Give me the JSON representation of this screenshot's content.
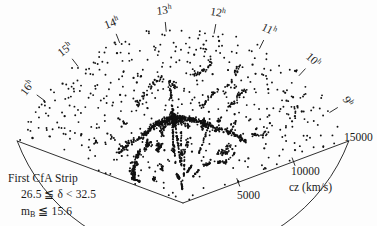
{
  "figure": {
    "name": "first-cfa-strip-redshift-wedge",
    "background_color": "#fdfdfd",
    "ink_color": "#1a1a1a"
  },
  "caption": {
    "line1": "First CfA Strip",
    "line2_pre": "26.5 ≦ δ < 32.5",
    "line3_pre": "m",
    "line3_sub": "B",
    "line3_post": " ≦ 15.6"
  },
  "axis": {
    "radial_title": "cz (km/s)",
    "tick_5000": "5000",
    "tick_10000": "10000",
    "tick_15000": "15000"
  },
  "hour_labels": [
    {
      "num": "16",
      "sup": "h"
    },
    {
      "num": "15",
      "sup": "h"
    },
    {
      "num": "14",
      "sup": "h"
    },
    {
      "num": "13",
      "sup": "h"
    },
    {
      "num": "12",
      "sup": "h"
    },
    {
      "num": "11",
      "sup": "h"
    },
    {
      "num": "10",
      "sup": "h"
    },
    {
      "num": "9",
      "sup": "h"
    }
  ],
  "chart_data": {
    "type": "scatter",
    "title": "First CfA Strip",
    "subtitle": "26.5 ≦ δ < 32.5, m_B ≦ 15.6",
    "projection": "polar-wedge",
    "xlabel": "Right Ascension (hours)",
    "ylabel": "cz (km/s)",
    "rlim": [
      0,
      15000
    ],
    "r_ticks": [
      5000,
      10000,
      15000
    ],
    "theta_label_unit": "h",
    "theta_ticks": [
      9,
      10,
      11,
      12,
      13,
      14,
      15,
      16
    ],
    "theta_range_hours": [
      8.3,
      17.0
    ],
    "grid": false,
    "legend": null,
    "annotations": [
      "Stickman structure near 13h, cz ~ 7000 km/s"
    ],
    "n_points": 1100,
    "geometry": {
      "apex_px": [
        183,
        203
      ],
      "radius_px": 177,
      "start_angle_deg": 200.5,
      "end_angle_deg": 339.5
    },
    "points_polar": [
      [
        16.82,
        13900
      ],
      [
        16.7,
        14300
      ],
      [
        16.62,
        12600
      ],
      [
        16.55,
        14800
      ],
      [
        16.48,
        13200
      ],
      [
        16.4,
        11700
      ],
      [
        16.36,
        14200
      ],
      [
        16.3,
        12100
      ],
      [
        16.22,
        13600
      ],
      [
        16.15,
        10400
      ],
      [
        16.1,
        14600
      ],
      [
        16.05,
        9100
      ],
      [
        15.98,
        12800
      ],
      [
        15.92,
        11200
      ],
      [
        15.86,
        13900
      ],
      [
        15.8,
        10100
      ],
      [
        15.74,
        14400
      ],
      [
        15.68,
        12300
      ],
      [
        15.62,
        8700
      ],
      [
        15.56,
        13100
      ],
      [
        15.5,
        11600
      ],
      [
        15.44,
        14100
      ],
      [
        15.38,
        9600
      ],
      [
        15.32,
        12900
      ],
      [
        15.26,
        10800
      ],
      [
        15.2,
        13700
      ],
      [
        15.14,
        11900
      ],
      [
        15.08,
        8300
      ],
      [
        15.02,
        14500
      ],
      [
        14.96,
        12400
      ],
      [
        14.9,
        10200
      ],
      [
        14.84,
        13300
      ],
      [
        14.78,
        9400
      ],
      [
        14.72,
        11500
      ],
      [
        14.66,
        14000
      ],
      [
        14.6,
        12700
      ],
      [
        14.54,
        10600
      ],
      [
        14.48,
        8900
      ],
      [
        14.42,
        13500
      ],
      [
        14.36,
        11100
      ],
      [
        14.3,
        14700
      ],
      [
        14.24,
        9800
      ],
      [
        14.18,
        12200
      ],
      [
        14.12,
        10400
      ],
      [
        14.06,
        13800
      ],
      [
        14.0,
        11400
      ],
      [
        13.94,
        8600
      ],
      [
        13.88,
        12900
      ],
      [
        13.82,
        14200
      ],
      [
        13.76,
        10000
      ],
      [
        13.7,
        11800
      ],
      [
        13.64,
        13400
      ],
      [
        13.58,
        9200
      ],
      [
        13.52,
        12500
      ],
      [
        13.46,
        10700
      ],
      [
        13.4,
        14900
      ],
      [
        13.34,
        11300
      ],
      [
        13.28,
        8400
      ],
      [
        13.22,
        13000
      ],
      [
        13.16,
        12000
      ],
      [
        13.1,
        9900
      ],
      [
        13.04,
        14300
      ],
      [
        12.98,
        11600
      ],
      [
        12.92,
        10300
      ],
      [
        12.86,
        13600
      ],
      [
        12.8,
        8800
      ],
      [
        12.74,
        12100
      ],
      [
        12.68,
        14600
      ],
      [
        12.62,
        9500
      ],
      [
        12.56,
        11000
      ],
      [
        12.5,
        13200
      ],
      [
        12.44,
        10900
      ],
      [
        12.38,
        12600
      ],
      [
        12.32,
        14000
      ],
      [
        12.26,
        9000
      ],
      [
        12.2,
        11700
      ],
      [
        12.14,
        13900
      ],
      [
        12.08,
        10500
      ],
      [
        12.02,
        12300
      ],
      [
        11.96,
        8200
      ],
      [
        11.9,
        14400
      ],
      [
        11.84,
        11200
      ],
      [
        11.78,
        13100
      ],
      [
        11.72,
        9700
      ],
      [
        11.66,
        12800
      ],
      [
        11.6,
        10100
      ],
      [
        11.54,
        14800
      ],
      [
        11.48,
        11900
      ],
      [
        11.42,
        13500
      ],
      [
        11.36,
        8500
      ],
      [
        11.3,
        12400
      ],
      [
        11.24,
        10600
      ],
      [
        11.18,
        14100
      ],
      [
        11.12,
        9300
      ],
      [
        11.06,
        11500
      ],
      [
        11.0,
        13700
      ],
      [
        10.94,
        12000
      ],
      [
        10.88,
        10800
      ],
      [
        10.82,
        14500
      ],
      [
        10.76,
        8700
      ],
      [
        10.7,
        13300
      ],
      [
        10.64,
        11400
      ],
      [
        10.58,
        9900
      ],
      [
        10.52,
        12700
      ],
      [
        10.46,
        14200
      ],
      [
        10.4,
        10300
      ],
      [
        10.34,
        13800
      ],
      [
        10.28,
        11800
      ],
      [
        10.22,
        9100
      ],
      [
        10.16,
        12500
      ],
      [
        10.1,
        14700
      ],
      [
        10.04,
        10700
      ],
      [
        9.98,
        13000
      ],
      [
        9.92,
        11100
      ],
      [
        9.86,
        8900
      ],
      [
        9.8,
        12900
      ],
      [
        9.74,
        14300
      ],
      [
        9.68,
        10000
      ],
      [
        9.62,
        13600
      ],
      [
        9.56,
        11600
      ],
      [
        9.5,
        9400
      ],
      [
        9.44,
        12200
      ],
      [
        9.38,
        14900
      ],
      [
        9.32,
        10900
      ],
      [
        9.26,
        13400
      ],
      [
        9.2,
        11300
      ],
      [
        9.14,
        8300
      ],
      [
        9.08,
        12600
      ],
      [
        9.02,
        14000
      ],
      [
        8.96,
        10200
      ],
      [
        8.9,
        13200
      ],
      [
        8.84,
        11700
      ],
      [
        8.78,
        9600
      ],
      [
        8.72,
        12100
      ],
      [
        8.66,
        14600
      ],
      [
        8.6,
        10500
      ],
      [
        8.54,
        13900
      ],
      [
        8.48,
        11000
      ],
      [
        8.42,
        8600
      ],
      [
        8.38,
        12800
      ]
    ]
  }
}
